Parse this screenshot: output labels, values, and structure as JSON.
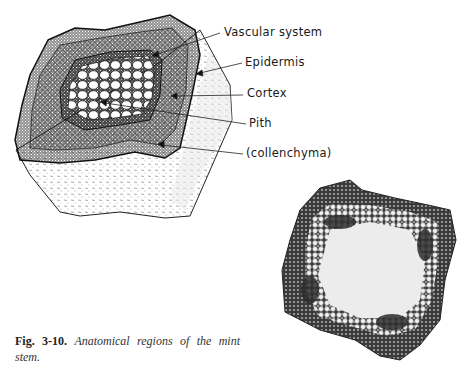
{
  "figure": {
    "number": "Fig. 3-10.",
    "caption_text": "Anatomical regions of the mint stem.",
    "labels": [
      {
        "text": "Vascular system",
        "x": 224,
        "y": 25
      },
      {
        "text": "Epidermis",
        "x": 245,
        "y": 55
      },
      {
        "text": "Cortex",
        "x": 247,
        "y": 86
      },
      {
        "text": "Pith",
        "x": 249,
        "y": 116
      },
      {
        "text": "(collenchyma)",
        "x": 246,
        "y": 146
      }
    ],
    "drawing_description": "Line drawing of mint stem block showing pith, vascular system, cortex, collenchyma and epidermis",
    "photo_description": "Micrograph cross-section of mint stem"
  }
}
